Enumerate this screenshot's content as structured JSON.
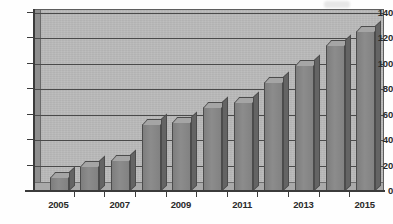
{
  "chart_data": {
    "type": "bar",
    "title": "",
    "subtitle": "",
    "xlabel": "",
    "ylabel": "",
    "categories": [
      "2005",
      "2006",
      "2007",
      "2008",
      "2009",
      "2010",
      "2011",
      "2012",
      "2013",
      "2014",
      "2015"
    ],
    "values": [
      11,
      20,
      24,
      53,
      54,
      66,
      70,
      86,
      99,
      115,
      126
    ],
    "x_tick_labels": [
      "2005",
      "",
      "2007",
      "",
      "2009",
      "",
      "2011",
      "",
      "2013",
      "",
      "2015"
    ],
    "y_ticks": [
      0,
      20,
      40,
      60,
      80,
      100,
      120,
      140
    ],
    "ylim": [
      0,
      140
    ],
    "grid": true,
    "legend": false,
    "legend_position": "none",
    "style": "3d-grayscale-scan",
    "colors": {
      "bar_front": "#858585",
      "bar_top": "#a5a5a5",
      "bar_side": "#646464",
      "plot_background": "#b9b9b9",
      "gridline": "#4a4a4a",
      "axis": "#3b3b3b",
      "text": "#2a2a2a",
      "page_background": "#ffffff"
    }
  },
  "axes": {
    "y_axis_name": "value-axis",
    "x_axis_name": "year-axis"
  }
}
